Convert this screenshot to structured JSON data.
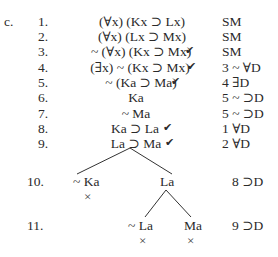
{
  "exercise_label": "c.",
  "rows": [
    {
      "num": "1.",
      "formula": "(∀x) (Kx ⊃ Lx)",
      "checked": false,
      "just": "SM"
    },
    {
      "num": "2.",
      "formula": "(∀x) (Lx ⊃ Mx)",
      "checked": false,
      "just": "SM"
    },
    {
      "num": "3.",
      "formula": "~ (∀x) (Kx ⊃ Mx)",
      "checked": true,
      "just": "SM"
    },
    {
      "num": "4.",
      "formula": "(∃x) ~ (Kx ⊃ Mx)",
      "checked": true,
      "just": "3 ~ ∀D"
    },
    {
      "num": "5.",
      "formula": "~ (Ka ⊃ Ma)",
      "checked": true,
      "just": "4 ∃D"
    },
    {
      "num": "6.",
      "formula": "Ka",
      "checked": false,
      "just": "5 ~ ⊃D"
    },
    {
      "num": "7.",
      "formula": "~ Ma",
      "checked": false,
      "just": "5 ~ ⊃D"
    },
    {
      "num": "8.",
      "formula": "Ka ⊃ La",
      "checked": true,
      "just": "1 ∀D"
    },
    {
      "num": "9.",
      "formula": "La ⊃ Ma",
      "checked": true,
      "just": "2 ∀D"
    }
  ],
  "check_glyph": "✔",
  "branch_rows": [
    {
      "num": "10.",
      "left": "~ Ka",
      "right": "La",
      "left_closed": true,
      "right_closed": false,
      "just": "8 ⊃D"
    },
    {
      "num": "11.",
      "left": "~ La",
      "right": "Ma",
      "left_closed": true,
      "right_closed": true,
      "just": "9 ⊃D"
    }
  ],
  "close_glyph": "×"
}
